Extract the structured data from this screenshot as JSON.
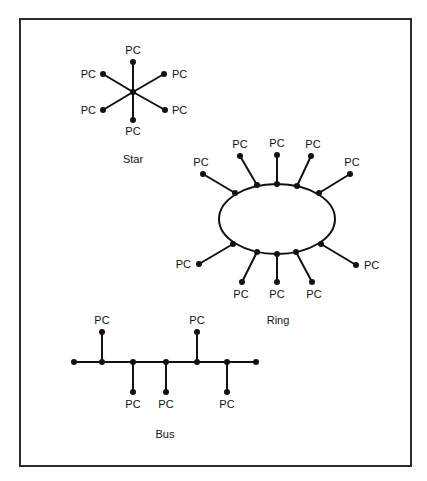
{
  "figure": {
    "frame": {
      "x": 20,
      "y": 19,
      "width": 391,
      "height": 447
    },
    "colors": {
      "line": "#111111",
      "frame": "#2a2a2a",
      "background": "#ffffff"
    },
    "node_label": "PC"
  },
  "topologies": {
    "star": {
      "title": "Star",
      "title_pos": {
        "x": 133,
        "y": 163
      },
      "center": {
        "x": 133,
        "y": 92
      },
      "nodes": [
        {
          "label": "PC",
          "x": 133,
          "y": 62,
          "lx": 133,
          "ly": 54,
          "anchor": "middle"
        },
        {
          "label": "PC",
          "x": 164,
          "y": 74,
          "lx": 172,
          "ly": 78,
          "anchor": "start"
        },
        {
          "label": "PC",
          "x": 165,
          "y": 110,
          "lx": 172,
          "ly": 114,
          "anchor": "start"
        },
        {
          "label": "PC",
          "x": 133,
          "y": 120,
          "lx": 133,
          "ly": 135,
          "anchor": "middle"
        },
        {
          "label": "PC",
          "x": 103,
          "y": 110,
          "lx": 96,
          "ly": 114,
          "anchor": "end"
        },
        {
          "label": "PC",
          "x": 103,
          "y": 74,
          "lx": 96,
          "ly": 78,
          "anchor": "end"
        }
      ]
    },
    "ring": {
      "title": "Ring",
      "title_pos": {
        "x": 278,
        "y": 324
      },
      "ellipse": {
        "cx": 277,
        "cy": 219,
        "rx": 58,
        "ry": 35
      },
      "nodes": [
        {
          "label": "PC",
          "ax": 235,
          "ay": 193,
          "x": 203,
          "y": 174,
          "lx": 201,
          "ly": 166,
          "anchor": "middle"
        },
        {
          "label": "PC",
          "ax": 257,
          "ay": 185,
          "x": 240,
          "y": 156,
          "lx": 240,
          "ly": 148,
          "anchor": "middle"
        },
        {
          "label": "PC",
          "ax": 277,
          "ay": 184,
          "x": 277,
          "y": 155,
          "lx": 277,
          "ly": 147,
          "anchor": "middle"
        },
        {
          "label": "PC",
          "ax": 297,
          "ay": 186,
          "x": 311,
          "y": 156,
          "lx": 313,
          "ly": 148,
          "anchor": "middle"
        },
        {
          "label": "PC",
          "ax": 319,
          "ay": 193,
          "x": 350,
          "y": 174,
          "lx": 352,
          "ly": 166,
          "anchor": "middle"
        },
        {
          "label": "PC",
          "ax": 233,
          "ay": 244,
          "x": 199,
          "y": 264,
          "lx": 191,
          "ly": 268,
          "anchor": "end"
        },
        {
          "label": "PC",
          "ax": 257,
          "ay": 252,
          "x": 242,
          "y": 282,
          "lx": 241,
          "ly": 298,
          "anchor": "middle"
        },
        {
          "label": "PC",
          "ax": 277,
          "ay": 254,
          "x": 277,
          "y": 282,
          "lx": 277,
          "ly": 298,
          "anchor": "middle"
        },
        {
          "label": "PC",
          "ax": 296,
          "ay": 252,
          "x": 312,
          "y": 282,
          "lx": 314,
          "ly": 298,
          "anchor": "middle"
        },
        {
          "label": "PC",
          "ax": 321,
          "ay": 244,
          "x": 356,
          "y": 265,
          "lx": 364,
          "ly": 269,
          "anchor": "start"
        }
      ]
    },
    "bus": {
      "title": "Bus",
      "title_pos": {
        "x": 165,
        "y": 438
      },
      "line": {
        "x1": 74,
        "x2": 256,
        "y": 362
      },
      "terminators": [
        {
          "x": 74,
          "y": 362
        },
        {
          "x": 256,
          "y": 362
        }
      ],
      "nodes": [
        {
          "label": "PC",
          "jx": 102,
          "x": 102,
          "y": 332,
          "lx": 102,
          "ly": 324,
          "anchor": "middle"
        },
        {
          "label": "PC",
          "jx": 133,
          "x": 133,
          "y": 392,
          "lx": 133,
          "ly": 408,
          "anchor": "middle"
        },
        {
          "label": "PC",
          "jx": 166,
          "x": 166,
          "y": 392,
          "lx": 166,
          "ly": 408,
          "anchor": "middle"
        },
        {
          "label": "PC",
          "jx": 197,
          "x": 197,
          "y": 332,
          "lx": 197,
          "ly": 324,
          "anchor": "middle"
        },
        {
          "label": "PC",
          "jx": 227,
          "x": 227,
          "y": 392,
          "lx": 227,
          "ly": 408,
          "anchor": "middle"
        }
      ]
    }
  }
}
